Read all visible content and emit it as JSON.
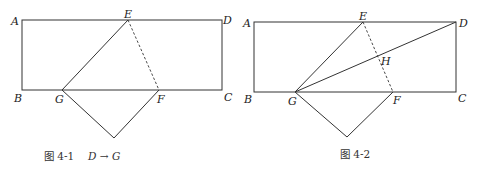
{
  "figures": [
    {
      "id": "4-1",
      "caption_prefix": "图 4-1",
      "caption_math": "D → G",
      "points": {
        "A": {
          "label": "A"
        },
        "B": {
          "label": "B"
        },
        "C": {
          "label": "C"
        },
        "D": {
          "label": "D"
        },
        "E": {
          "label": "E"
        },
        "F": {
          "label": "F"
        },
        "G": {
          "label": "G"
        }
      },
      "description": "Rectangle ABCD folded along dashed crease EF so that D maps to G on BC"
    },
    {
      "id": "4-2",
      "caption_prefix": "图 4-2",
      "points": {
        "A": {
          "label": "A"
        },
        "B": {
          "label": "B"
        },
        "C": {
          "label": "C"
        },
        "D": {
          "label": "D"
        },
        "E": {
          "label": "E"
        },
        "F": {
          "label": "F"
        },
        "G": {
          "label": "G"
        },
        "H": {
          "label": "H"
        }
      },
      "description": "Same fold with segment GD drawn, intersecting crease EF at H"
    }
  ]
}
